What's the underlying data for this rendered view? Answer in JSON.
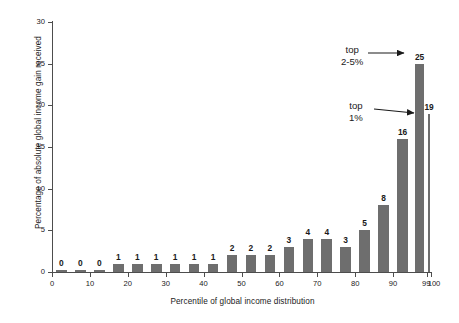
{
  "chart_data": {
    "type": "bar",
    "title": "",
    "xlabel": "Percentile of global income distribution",
    "ylabel": "Percentage of absolute global income gain received",
    "xlim": [
      0,
      100
    ],
    "ylim": [
      0,
      30
    ],
    "grid": false,
    "legend": "none",
    "bar_color": "#6e6e6e",
    "axis_color": "#4d4d4d",
    "xticks": [
      "0",
      "10",
      "20",
      "30",
      "40",
      "50",
      "60",
      "70",
      "80",
      "90",
      "99",
      "100"
    ],
    "xtick_values": [
      0,
      10,
      20,
      30,
      40,
      50,
      60,
      70,
      80,
      90,
      99,
      100
    ],
    "yticks": [
      "0",
      "5",
      "10",
      "15",
      "20",
      "25",
      "30"
    ],
    "ytick_values": [
      0,
      5,
      10,
      15,
      20,
      25,
      30
    ],
    "categories": [
      "0-5",
      "5-10",
      "10-15",
      "15-20",
      "20-25",
      "25-30",
      "30-35",
      "35-40",
      "40-45",
      "45-50",
      "50-55",
      "55-60",
      "60-65",
      "65-70",
      "70-75",
      "75-80",
      "80-85",
      "85-90",
      "90-95",
      "95-99",
      "99-100"
    ],
    "values": [
      0,
      0,
      0,
      1,
      1,
      1,
      1,
      1,
      1,
      2,
      2,
      2,
      3,
      4,
      4,
      3,
      5,
      8,
      16,
      25,
      19
    ],
    "bar_labels": [
      "0",
      "0",
      "0",
      "1",
      "1",
      "1",
      "1",
      "1",
      "1",
      "2",
      "2",
      "2",
      "3",
      "4",
      "4",
      "3",
      "5",
      "8",
      "16",
      "25",
      "19"
    ],
    "bar_spans": [
      {
        "x0": 0,
        "x1": 5
      },
      {
        "x0": 5,
        "x1": 10
      },
      {
        "x0": 10,
        "x1": 15
      },
      {
        "x0": 15,
        "x1": 20
      },
      {
        "x0": 20,
        "x1": 25
      },
      {
        "x0": 25,
        "x1": 30
      },
      {
        "x0": 30,
        "x1": 35
      },
      {
        "x0": 35,
        "x1": 40
      },
      {
        "x0": 40,
        "x1": 45
      },
      {
        "x0": 45,
        "x1": 50
      },
      {
        "x0": 50,
        "x1": 55
      },
      {
        "x0": 55,
        "x1": 60
      },
      {
        "x0": 60,
        "x1": 65
      },
      {
        "x0": 65,
        "x1": 70
      },
      {
        "x0": 70,
        "x1": 75
      },
      {
        "x0": 75,
        "x1": 80
      },
      {
        "x0": 80,
        "x1": 85
      },
      {
        "x0": 85,
        "x1": 90
      },
      {
        "x0": 90,
        "x1": 95
      },
      {
        "x0": 95,
        "x1": 99
      },
      {
        "x0": 99,
        "x1": 100
      }
    ],
    "annotations": [
      {
        "id": "top-2-5",
        "line1": "top",
        "line2": "2-5%",
        "target_value": 25,
        "target_category": "95-99"
      },
      {
        "id": "top-1",
        "line1": "top",
        "line2": "1%",
        "target_value": 19,
        "target_category": "99-100"
      }
    ]
  }
}
